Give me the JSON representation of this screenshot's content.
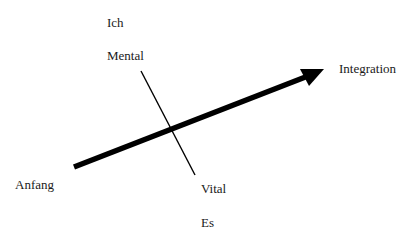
{
  "diagram": {
    "labels": {
      "top": "Ich",
      "upper_axis": "Mental",
      "lower_axis": "Vital",
      "bottom": "Es",
      "arrow_start": "Anfang",
      "arrow_end": "Integration"
    },
    "arrow": {
      "from": [
        74,
        167
      ],
      "to": [
        324,
        69
      ],
      "color": "#000000"
    },
    "axis_line": {
      "from": [
        141,
        71
      ],
      "to": [
        195,
        175
      ],
      "color": "#000000"
    }
  }
}
